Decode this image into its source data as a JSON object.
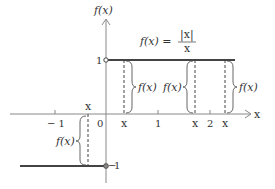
{
  "formula": {
    "lhs": "f(x) =",
    "numerator": "|x|",
    "denominator": "x"
  },
  "axes": {
    "x_label": "x",
    "y_label": "f(x)",
    "x_ticks": [
      "-1",
      "0",
      "1",
      "2"
    ],
    "y_ticks": [
      "1",
      "-1"
    ]
  },
  "pieces": [
    {
      "domain": "x > 0",
      "value": 1,
      "endpoint": "open circle at (0,1)"
    },
    {
      "domain": "x < 0",
      "value": -1,
      "endpoint": "filled circle at (0,-1)"
    }
  ],
  "annotations": {
    "sample_x_label": "x",
    "brace_label": "f(x)",
    "sample_points": [
      "x (negative, left of 0)",
      "x (between 0 and 1)",
      "x (between 1 and 2)",
      "x (right of 2)"
    ]
  },
  "colors": {
    "line": "#444444",
    "axis": "#888888",
    "text": "#333333"
  }
}
